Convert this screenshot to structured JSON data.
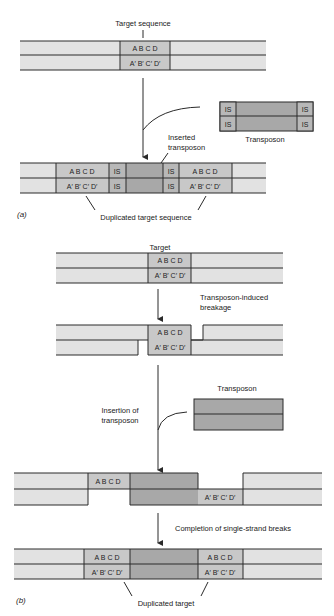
{
  "colors": {
    "dna_light": "#e2e2e2",
    "target_mid": "#c8c8c8",
    "transposon_dark": "#a8a8a8",
    "is_element": "#b8b8b8",
    "line": "#2a2a2a"
  },
  "panel_a": {
    "label": "(a)",
    "target_sequence_label": "Target sequence",
    "top_strand": "A  B  C  D",
    "bottom_strand": "A′ B′ C′ D′",
    "transposon_label": "Transposon",
    "is_label": "IS",
    "inserted_label_line1": "Inserted",
    "inserted_label_line2": "transposon",
    "duplicated_label": "Duplicated target sequence"
  },
  "panel_b": {
    "label": "(b)",
    "target_label": "Target",
    "top_strand": "A  B  C  D",
    "bottom_strand": "A′ B′ C′ D′",
    "breakage_line1": "Transposon-induced",
    "breakage_line2": "breakage",
    "insertion_line1": "Insertion of",
    "insertion_line2": "transposon",
    "transposon_label": "Transposon",
    "completion_label": "Completion of single-strand breaks",
    "duplicated_label": "Duplicated target"
  }
}
